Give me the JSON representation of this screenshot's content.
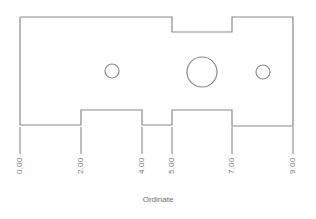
{
  "drawing": {
    "title": "Ordinate",
    "stroke_color": "#8a8a8a",
    "text_color": "#7a7a7a",
    "outline_points": "20,17 172,17 172,32 232,32 232,17 293,17 293,126 232,126 232,110 172,110 172,125 142,125 142,110 81,110 81,125 20,125 20,17",
    "holes": [
      {
        "name": "left-small-hole",
        "cx": 112,
        "cy": 71,
        "r": 7
      },
      {
        "name": "center-large-hole",
        "cx": 202,
        "cy": 72,
        "r": 15
      },
      {
        "name": "right-small-hole",
        "cx": 263,
        "cy": 72,
        "r": 7
      }
    ],
    "ordinates": [
      {
        "label": "0.00",
        "x": 20
      },
      {
        "label": "2.00",
        "x": 81
      },
      {
        "label": "4.00",
        "x": 142
      },
      {
        "label": "5.00",
        "x": 172
      },
      {
        "label": "7.00",
        "x": 232
      },
      {
        "label": "9.00",
        "x": 293
      }
    ],
    "extension_line_bottom": 154
  }
}
